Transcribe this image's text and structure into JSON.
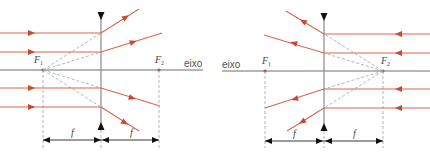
{
  "colors": {
    "ray": "#d9664f",
    "arrow": "#c9482f",
    "axis": "#6e6e6e",
    "lens": "#8a8a8a",
    "dashed": "#9aa3ad",
    "dimension": "#222222"
  },
  "left_diagram": {
    "axis_label": "eixo",
    "focus_1_label": "F",
    "focus_1_sub": "1",
    "focus_2_label": "F",
    "focus_2_sub": "2",
    "focal_length_label_1": "f",
    "focal_length_label_2": "f",
    "lens_type": "diverging",
    "ray_direction": "left-to-right"
  },
  "right_diagram": {
    "axis_label": "eixo",
    "focus_1_label": "F",
    "focus_1_sub": "1",
    "focus_2_label": "F",
    "focus_2_sub": "2",
    "focal_length_label_1": "f",
    "focal_length_label_2": "f",
    "lens_type": "diverging",
    "ray_direction": "right-to-left"
  }
}
